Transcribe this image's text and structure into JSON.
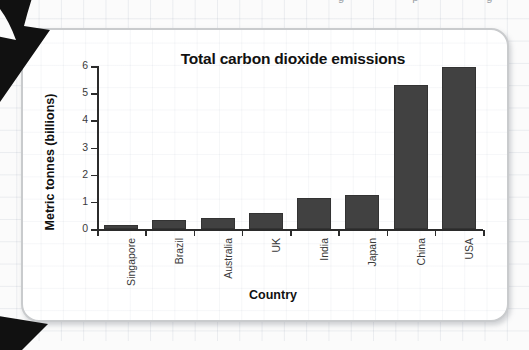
{
  "page": {
    "cropped_text_top": "g p g",
    "background_color": "#fbfbfb",
    "card_color": "#ffffff",
    "card_border_color": "#c9cbcd",
    "arrow_color": "#111111"
  },
  "annotations": {
    "top_arrow_name": "pointer-arrow-top",
    "bottom_arrow_name": "pointer-arrow-bottom"
  },
  "chart_data": {
    "type": "bar",
    "title": "Total carbon dioxide emissions",
    "xlabel": "Country",
    "ylabel": "Metric tonnes (billions)",
    "categories": [
      "Singapore",
      "Brazil",
      "Australia",
      "UK",
      "India",
      "Japan",
      "China",
      "USA"
    ],
    "values": [
      0.15,
      0.35,
      0.4,
      0.6,
      1.15,
      1.25,
      5.3,
      5.95
    ],
    "ylim": [
      0,
      6
    ],
    "yticks": [
      0,
      1,
      2,
      3,
      4,
      5,
      6
    ],
    "ytick_labels": [
      "0",
      "1",
      "2",
      "3",
      "4",
      "5",
      "6"
    ],
    "grid": false,
    "legend": false,
    "bar_color": "#414141",
    "bar_border_color": "#333333",
    "axis_color": "#2b2b2b"
  }
}
